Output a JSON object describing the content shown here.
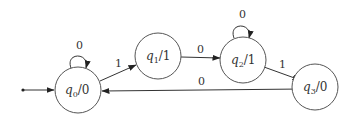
{
  "diagram": {
    "type": "moore-machine",
    "start_state": "q0",
    "states": [
      {
        "id": "q0",
        "name": "q",
        "sub": "0",
        "output": "/0",
        "cx": 78,
        "cy": 90
      },
      {
        "id": "q1",
        "name": "q",
        "sub": "1",
        "output": "/1",
        "cx": 158,
        "cy": 56
      },
      {
        "id": "q2",
        "name": "q",
        "sub": "2",
        "output": "/1",
        "cx": 243,
        "cy": 60
      },
      {
        "id": "q3",
        "name": "q",
        "sub": "3",
        "output": "/0",
        "cx": 315,
        "cy": 87
      }
    ],
    "transitions": [
      {
        "from": "q0",
        "to": "q0",
        "label": "0"
      },
      {
        "from": "q0",
        "to": "q1",
        "label": "1"
      },
      {
        "from": "q1",
        "to": "q2",
        "label": "0"
      },
      {
        "from": "q2",
        "to": "q2",
        "label": "0"
      },
      {
        "from": "q2",
        "to": "q3",
        "label": "1"
      },
      {
        "from": "q3",
        "to": "q0",
        "label": "0"
      }
    ]
  }
}
